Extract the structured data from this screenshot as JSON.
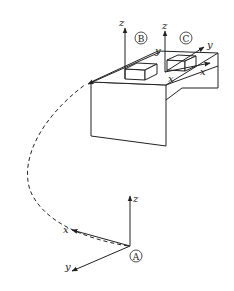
{
  "figure": {
    "type": "3D coordinate frames diagram",
    "frames": [
      {
        "id": "A",
        "label": "A",
        "axes": {
          "x": "x",
          "y": "y",
          "z": "z"
        }
      },
      {
        "id": "B",
        "label": "B",
        "axes": {
          "x": "x",
          "y": "y",
          "z": "z"
        }
      },
      {
        "id": "C",
        "label": "C",
        "axes": {
          "x": "x",
          "y": "y",
          "z": "z"
        }
      }
    ],
    "frame_A": {
      "x_label": "x",
      "y_label": "y",
      "z_label": "z",
      "marker": "A"
    },
    "frame_B": {
      "x_label": "x",
      "y_label": "y",
      "z_label": "z",
      "marker": "B"
    },
    "frame_C": {
      "x_label": "x",
      "y_label": "y",
      "z_label": "z",
      "marker": "C"
    },
    "path": {
      "style": "dashed",
      "from": "A",
      "to": "B"
    },
    "colors": {
      "line": "#222222",
      "background": "#ffffff"
    }
  }
}
